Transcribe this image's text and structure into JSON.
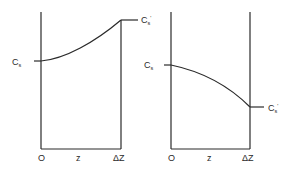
{
  "figure": {
    "panels": [
      {
        "id": "left",
        "description": "Concentration increasing from Cs at z=0 to C's at z=ΔZ",
        "labels": {
          "left_value": "C",
          "left_value_sub": "s",
          "right_value": "C",
          "right_value_sub": "s",
          "right_value_prime": "'",
          "x_origin": "O",
          "x_var": "z",
          "x_end": "ΔZ"
        }
      },
      {
        "id": "right",
        "description": "Concentration decreasing from Cs at z=0 to C's at z=ΔZ",
        "labels": {
          "left_value": "C",
          "left_value_sub": "s",
          "right_value": "C",
          "right_value_sub": "s",
          "right_value_prime": "'",
          "x_origin": "O",
          "x_var": "z",
          "x_end": "ΔZ"
        }
      }
    ],
    "colors": {
      "line": "#2a2a2a",
      "background": "#ffffff"
    }
  }
}
